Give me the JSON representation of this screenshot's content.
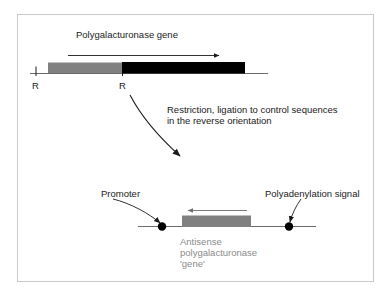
{
  "figure": {
    "kind": "molecular-biology-schematic",
    "topic": "Construction of an antisense polygalacturonase gene",
    "border_color": "#c9c9c9",
    "background_color": "#ffffff"
  },
  "colors": {
    "gray_segment": "#808080",
    "black_segment": "#000000",
    "dna_line": "#555555",
    "text": "#1a1a1a",
    "muted_text": "#8a8a8a",
    "node_dot": "#000000"
  },
  "top_panel": {
    "title": "Polygalacturonase gene",
    "transcription_arrow": {
      "direction": "right",
      "x_start": 68,
      "x_end": 223,
      "y": 55
    },
    "dna_line": {
      "x_start": 30,
      "x_end": 268,
      "y": 73
    },
    "segments": [
      {
        "name": "promoter-upstream-segment",
        "fill": "#808080",
        "x_start": 48,
        "x_end": 122
      },
      {
        "name": "coding-segment",
        "fill": "#000000",
        "x_start": 122,
        "x_end": 245
      }
    ],
    "restriction_sites": [
      {
        "label": "R",
        "x": 36
      },
      {
        "label": "R",
        "x": 122
      }
    ]
  },
  "process": {
    "caption_line_1": "Restriction, ligation to control sequences",
    "caption_line_2": "in the reverse orientation",
    "arrow": {
      "direction": "down-right-curved",
      "x_start": 130,
      "y_start": 95,
      "x_end": 194,
      "y_end": 171
    }
  },
  "bottom_panel": {
    "promoter_label": "Promoter",
    "polyadenylation_label": "Polyadenylation signal",
    "antisense_caption_line_1": "Antisense",
    "antisense_caption_line_2": "polygalacturonase",
    "antisense_caption_line_3": "'gene'",
    "construct_line": {
      "x_start": 138,
      "x_end": 316,
      "y": 226
    },
    "promoter_node": {
      "x": 162,
      "y": 226
    },
    "polyadenylation_node": {
      "x": 289,
      "y": 226
    },
    "antisense_box": {
      "fill": "#808080",
      "x_start": 182,
      "x_end": 251,
      "y_top": 216,
      "y_bottom": 228
    },
    "antisense_arrow": {
      "direction": "left",
      "x_start": 247,
      "x_end": 184,
      "y": 210
    }
  }
}
